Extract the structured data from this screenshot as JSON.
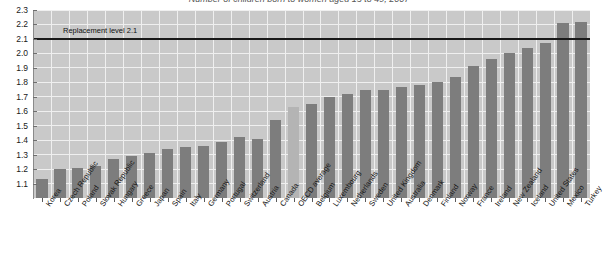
{
  "chart_data": {
    "type": "bar",
    "title": "Number of children born to women aged 15 to 49, 2007",
    "xlabel": "",
    "ylabel": "",
    "ylim": [
      1.0,
      2.3
    ],
    "ytick_labels": [
      "2.3",
      "2.2",
      "2.1",
      "2.0",
      "1.9",
      "1.8",
      "1.7",
      "1.6",
      "1.5",
      "1.4",
      "1.3",
      "1.2",
      "1.1"
    ],
    "ytick_values": [
      2.3,
      2.2,
      2.1,
      2.0,
      1.9,
      1.8,
      1.7,
      1.6,
      1.5,
      1.4,
      1.3,
      1.2,
      1.1
    ],
    "grid": true,
    "legend": "none",
    "annotations": [
      {
        "name": "replacement-level",
        "label": "Replacement level 2.1",
        "value": 2.1,
        "type": "hline"
      }
    ],
    "highlight_category": "OECD average",
    "categories": [
      "Korea",
      "Czech Republic",
      "Poland",
      "Slovak Republic",
      "Hungary",
      "Greece",
      "Japan",
      "Spain",
      "Italy",
      "Germany",
      "Portugal",
      "Switzerland",
      "Austria",
      "Canada",
      "OECD average",
      "Belgium",
      "Luxembourg",
      "Netherlands",
      "Sweden",
      "United Kingdom",
      "Australia",
      "Denmark",
      "Finland",
      "Norway",
      "France",
      "Ireland",
      "New Zealand",
      "Iceland",
      "United States",
      "Mexico",
      "Turkey"
    ],
    "values": [
      1.13,
      1.2,
      1.21,
      1.22,
      1.27,
      1.29,
      1.31,
      1.34,
      1.35,
      1.36,
      1.39,
      1.42,
      1.41,
      1.54,
      1.63,
      1.65,
      1.7,
      1.72,
      1.75,
      1.75,
      1.77,
      1.78,
      1.8,
      1.84,
      1.91,
      1.96,
      2.0,
      2.04,
      2.07,
      2.21,
      2.22
    ]
  },
  "colors": {
    "plot_background": "#c9c9c9",
    "grid": "#efefef",
    "bar": "#7d7d7d",
    "bar_highlight": "#b4b4b4",
    "replacement_line": "#1a1a1a",
    "axis": "#8a8a8a"
  }
}
